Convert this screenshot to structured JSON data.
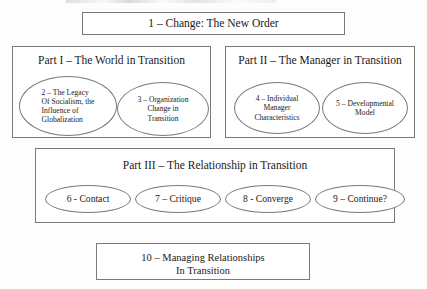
{
  "diagram": {
    "type": "book-structure-outline",
    "top_box": {
      "label": "1 – Change: The New Order"
    },
    "parts": [
      {
        "id": "part-1",
        "title": "Part I – The World in Transition",
        "chapters": [
          {
            "id": "chapter-2",
            "align": "left",
            "lines": [
              "2 – The Legacy",
              "Of Socialism, the",
              "Influence of",
              "Globalization"
            ]
          },
          {
            "id": "chapter-3",
            "align": "center",
            "lines": [
              "3 – Organization",
              "Change in",
              "Transition"
            ]
          }
        ]
      },
      {
        "id": "part-2",
        "title": "Part II – The Manager in Transition",
        "chapters": [
          {
            "id": "chapter-4",
            "align": "center",
            "lines": [
              "4 – Individual",
              "Manager",
              "Characteristics"
            ]
          },
          {
            "id": "chapter-5",
            "align": "center",
            "lines": [
              "5 – Developmental",
              "Model"
            ]
          }
        ]
      },
      {
        "id": "part-3",
        "title": "Part III – The Relationship in Transition",
        "chapters": [
          {
            "id": "chapter-6",
            "align": "center",
            "lines": [
              "6 - Contact"
            ]
          },
          {
            "id": "chapter-7",
            "align": "center",
            "lines": [
              "7 – Critique"
            ]
          },
          {
            "id": "chapter-8",
            "align": "center",
            "lines": [
              "8 - Converge"
            ]
          },
          {
            "id": "chapter-9",
            "align": "center",
            "lines": [
              "9 – Continue?"
            ]
          }
        ]
      }
    ],
    "bottom_box": {
      "line1": "10 – Managing Relationships",
      "line2": "In Transition"
    },
    "colors": {
      "background": "#fdfdfd",
      "stroke": "#7a7a7a",
      "text": "#1a1a1a"
    }
  }
}
